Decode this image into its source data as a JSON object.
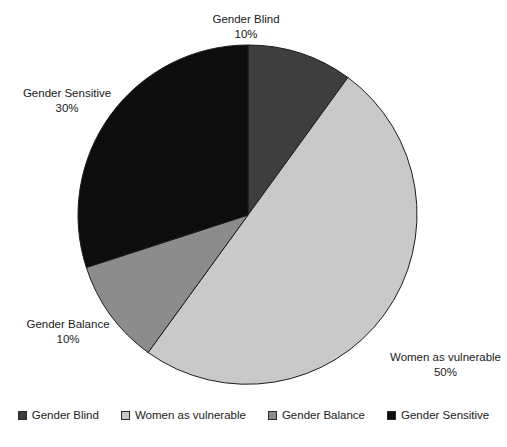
{
  "background_color": "#ffffff",
  "chart_data": {
    "type": "pie",
    "title": "",
    "labels": [
      "Gender Blind",
      "Women as vulnerable",
      "Gender Balance",
      "Gender Sensitive"
    ],
    "values": [
      10,
      50,
      10,
      30
    ],
    "value_suffix": "%",
    "colors": [
      "#3e3e3e",
      "#c9c9c9",
      "#8c8c8c",
      "#0d0d0d"
    ],
    "slice_border_color": "#1c1c1c",
    "start_angle_deg": 0,
    "direction": "clockwise",
    "legend": {
      "position": "bottom",
      "entries": [
        {
          "label": "Gender Blind",
          "color": "#3e3e3e"
        },
        {
          "label": "Women as vulnerable",
          "color": "#c9c9c9"
        },
        {
          "label": "Gender Balance",
          "color": "#8c8c8c"
        },
        {
          "label": "Gender Sensitive",
          "color": "#0d0d0d"
        }
      ]
    },
    "geometry": {
      "cx": 248,
      "cy": 215,
      "r": 170
    }
  },
  "callouts": {
    "gender_blind": {
      "name": "Gender Blind",
      "value": "10%"
    },
    "gender_sensitive": {
      "name": "Gender Sensitive",
      "value": "30%"
    },
    "gender_balance": {
      "name": "Gender Balance",
      "value": "10%"
    },
    "women_vulnerable": {
      "name": "Women as vulnerable",
      "value": "50%"
    }
  },
  "caption": {
    "text": ""
  }
}
